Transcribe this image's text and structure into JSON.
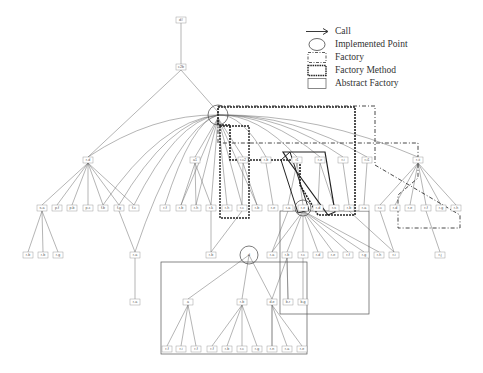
{
  "figure": {
    "type": "call-graph",
    "background": "#ffffff",
    "line_color": "#555555"
  },
  "legend": {
    "items": [
      {
        "id": "call",
        "label": "Call",
        "symbol": "arrow-icon"
      },
      {
        "id": "implemented_point",
        "label": "Implemented Point",
        "symbol": "circle-icon"
      },
      {
        "id": "factory",
        "label": "Factory",
        "symbol": "dash-dot-box-icon"
      },
      {
        "id": "factory_method",
        "label": "Factory Method",
        "symbol": "thick-dashed-box-icon"
      },
      {
        "id": "abstract_factory",
        "label": "Abstract Factory",
        "symbol": "solid-box-icon"
      }
    ]
  },
  "nodes": [
    {
      "id": "n_root",
      "label": "d#",
      "x": 181,
      "y": 20
    },
    {
      "id": "n_l1",
      "label": "c2b",
      "x": 181,
      "y": 67
    },
    {
      "id": "n_hub",
      "label": "h",
      "x": 218,
      "y": 115
    },
    {
      "id": "n_a",
      "label": "r-d",
      "x": 88,
      "y": 160
    },
    {
      "id": "n_b",
      "label": "a1",
      "x": 195,
      "y": 160
    },
    {
      "id": "n_c",
      "label": "r-c2",
      "x": 243,
      "y": 160
    },
    {
      "id": "n_d",
      "label": "r-b",
      "x": 266,
      "y": 160
    },
    {
      "id": "n_e",
      "label": "r1",
      "x": 297,
      "y": 160
    },
    {
      "id": "n_f",
      "label": "r-e",
      "x": 320,
      "y": 160
    },
    {
      "id": "n_g",
      "label": "r-i",
      "x": 343,
      "y": 160
    },
    {
      "id": "n_h",
      "label": "r-i1",
      "x": 367,
      "y": 160
    },
    {
      "id": "n_i",
      "label": "r-ii",
      "x": 418,
      "y": 160
    },
    {
      "id": "m1",
      "label": "s-a",
      "x": 42,
      "y": 208
    },
    {
      "id": "m2",
      "label": "p-f",
      "x": 57,
      "y": 208
    },
    {
      "id": "m3",
      "label": "p-b",
      "x": 72,
      "y": 208
    },
    {
      "id": "m4",
      "label": "p-c",
      "x": 88,
      "y": 208
    },
    {
      "id": "m5",
      "label": "f-b",
      "x": 103,
      "y": 208
    },
    {
      "id": "m6",
      "label": "f-g",
      "x": 119,
      "y": 208
    },
    {
      "id": "m7",
      "label": "f-c",
      "x": 134,
      "y": 208
    },
    {
      "id": "m8",
      "label": "r-f",
      "x": 165,
      "y": 208
    },
    {
      "id": "m9",
      "label": "r-b",
      "x": 181,
      "y": 208
    },
    {
      "id": "m10",
      "label": "r-h",
      "x": 196,
      "y": 208
    },
    {
      "id": "m11",
      "label": "r-k",
      "x": 211,
      "y": 208
    },
    {
      "id": "m12",
      "label": "r-h",
      "x": 227,
      "y": 208
    },
    {
      "id": "m13",
      "label": "r-c",
      "x": 242,
      "y": 208
    },
    {
      "id": "m14",
      "label": "r-b",
      "x": 257,
      "y": 208
    },
    {
      "id": "m15",
      "label": "r-e",
      "x": 273,
      "y": 208
    },
    {
      "id": "m16",
      "label": "r-a",
      "x": 288,
      "y": 208
    },
    {
      "id": "m17",
      "label": "r-e",
      "x": 303,
      "y": 208
    },
    {
      "id": "m18",
      "label": "r-d",
      "x": 318,
      "y": 208
    },
    {
      "id": "m19",
      "label": "r-s",
      "x": 334,
      "y": 208
    },
    {
      "id": "m20",
      "label": "r-b",
      "x": 349,
      "y": 208
    },
    {
      "id": "m21",
      "label": "r-a",
      "x": 364,
      "y": 208
    },
    {
      "id": "m22",
      "label": "r-c",
      "x": 380,
      "y": 208
    },
    {
      "id": "m23",
      "label": "r-d",
      "x": 395,
      "y": 208
    },
    {
      "id": "m24",
      "label": "r-e",
      "x": 410,
      "y": 208
    },
    {
      "id": "m25",
      "label": "r-f",
      "x": 426,
      "y": 208
    },
    {
      "id": "m26",
      "label": "r-g",
      "x": 441,
      "y": 208
    },
    {
      "id": "m27",
      "label": "r-h",
      "x": 456,
      "y": 208
    },
    {
      "id": "b1",
      "label": "r-b",
      "x": 28,
      "y": 255
    },
    {
      "id": "b2",
      "label": "r-b",
      "x": 43,
      "y": 255
    },
    {
      "id": "b3",
      "label": "r-g",
      "x": 58,
      "y": 255
    },
    {
      "id": "b4",
      "label": "r-a",
      "x": 135,
      "y": 255
    },
    {
      "id": "b5",
      "label": "r-b",
      "x": 211,
      "y": 255
    },
    {
      "id": "b6",
      "label": "r-a",
      "x": 272,
      "y": 255
    },
    {
      "id": "b7",
      "label": "r-b",
      "x": 287,
      "y": 255
    },
    {
      "id": "b8",
      "label": "r-c",
      "x": 303,
      "y": 255
    },
    {
      "id": "b9",
      "label": "r-d",
      "x": 318,
      "y": 255
    },
    {
      "id": "b10",
      "label": "r-e",
      "x": 333,
      "y": 255
    },
    {
      "id": "b11",
      "label": "r-f",
      "x": 348,
      "y": 255
    },
    {
      "id": "b12",
      "label": "r-g",
      "x": 364,
      "y": 255
    },
    {
      "id": "b13",
      "label": "r-h",
      "x": 379,
      "y": 255
    },
    {
      "id": "b14",
      "label": "r-i",
      "x": 394,
      "y": 255
    },
    {
      "id": "b15",
      "label": "r-j",
      "x": 440,
      "y": 255
    },
    {
      "id": "c1",
      "label": "r-a",
      "x": 135,
      "y": 302
    },
    {
      "id": "c2",
      "label": "a",
      "x": 188,
      "y": 302
    },
    {
      "id": "c3",
      "label": "r-b",
      "x": 242,
      "y": 302
    },
    {
      "id": "c4",
      "label": "d-e",
      "x": 272,
      "y": 302
    },
    {
      "id": "c5",
      "label": "b-r",
      "x": 288,
      "y": 302
    },
    {
      "id": "c6",
      "label": "b-g",
      "x": 303,
      "y": 302
    },
    {
      "id": "d1",
      "label": "r-f",
      "x": 167,
      "y": 349
    },
    {
      "id": "d2",
      "label": "r-i",
      "x": 181,
      "y": 349
    },
    {
      "id": "d3",
      "label": "r-f",
      "x": 196,
      "y": 349
    },
    {
      "id": "d4",
      "label": "r-f",
      "x": 212,
      "y": 349
    },
    {
      "id": "d5",
      "label": "r-b",
      "x": 227,
      "y": 349
    },
    {
      "id": "d6",
      "label": "r-c",
      "x": 242,
      "y": 349
    },
    {
      "id": "d7",
      "label": "r-g",
      "x": 257,
      "y": 349
    },
    {
      "id": "d8",
      "label": "r-n",
      "x": 272,
      "y": 349
    },
    {
      "id": "d9",
      "label": "r-a",
      "x": 287,
      "y": 349
    },
    {
      "id": "d10",
      "label": "r-e",
      "x": 302,
      "y": 349
    }
  ],
  "implemented_points": [
    {
      "id": "ip1",
      "label": "h",
      "cx": 218,
      "cy": 115,
      "r": 10
    },
    {
      "id": "ip2",
      "label": "d",
      "cx": 249,
      "cy": 255,
      "r": 9
    },
    {
      "id": "ip3",
      "label": "r-a",
      "cx": 303,
      "cy": 208,
      "r": 8
    }
  ]
}
